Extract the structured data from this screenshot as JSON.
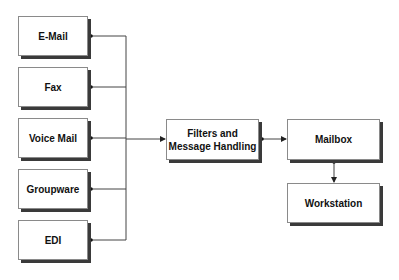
{
  "diagram": {
    "sources": [
      {
        "id": "email",
        "label": "E-Mail"
      },
      {
        "id": "fax",
        "label": "Fax"
      },
      {
        "id": "voicemail",
        "label": "Voice Mail"
      },
      {
        "id": "groupware",
        "label": "Groupware"
      },
      {
        "id": "edi",
        "label": "EDI"
      }
    ],
    "processor": {
      "id": "filters",
      "label_line1": "Filters and",
      "label_line2": "Message Handling"
    },
    "mailbox": {
      "id": "mailbox",
      "label": "Mailbox"
    },
    "workstation": {
      "id": "workstation",
      "label": "Workstation"
    },
    "edges": [
      {
        "from": "email",
        "to": "filters",
        "type": "bus"
      },
      {
        "from": "fax",
        "to": "filters",
        "type": "bus"
      },
      {
        "from": "voicemail",
        "to": "filters",
        "type": "bus"
      },
      {
        "from": "groupware",
        "to": "filters",
        "type": "bus"
      },
      {
        "from": "edi",
        "to": "filters",
        "type": "bus"
      },
      {
        "from": "filters",
        "to": "mailbox",
        "type": "arrow"
      },
      {
        "from": "mailbox",
        "to": "workstation",
        "type": "arrow"
      }
    ],
    "colors": {
      "line": "#222222",
      "border": "#8a8a8a",
      "shadow": "#3a3a3a"
    }
  }
}
